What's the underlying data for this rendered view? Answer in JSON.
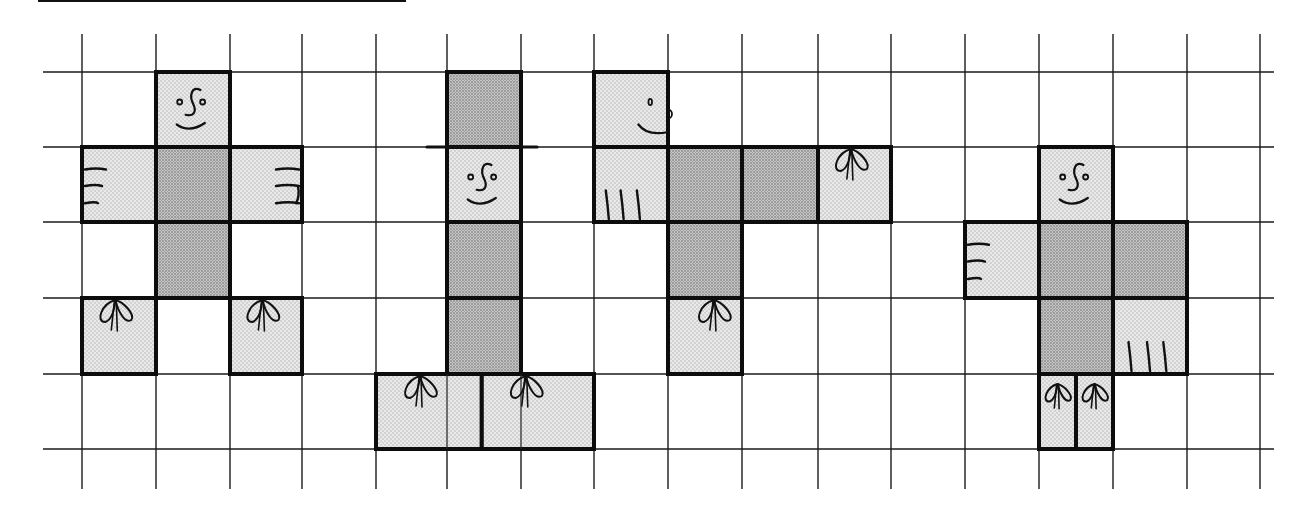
{
  "colors": {
    "background": "#ffffff",
    "grid_line": "#1a1a1a",
    "outline": "#0d0d0d",
    "light_fill": "#e9e9e9",
    "light_dot": "#b5b5b5",
    "dark_fill": "#bdbdbd",
    "dark_dot": "#8a8a8a"
  },
  "grid": {
    "columns_x": [
      82,
      156,
      230,
      302,
      376,
      447,
      521,
      594,
      668,
      742,
      818,
      891,
      965,
      1039,
      1113,
      1187,
      1260
    ],
    "rows_y": [
      72,
      147,
      222,
      298,
      374,
      449
    ],
    "h_line_start_x": 43,
    "h_line_end_x": 1274,
    "v_line_start_y": 34,
    "v_line_end_y": 489
  },
  "figures": [
    {
      "name": "figure-1-cross-net",
      "cells": [
        {
          "col": 1,
          "row": 0,
          "w": 1,
          "shade": "light",
          "decor": "face-front"
        },
        {
          "col": 0,
          "row": 1,
          "w": 1,
          "shade": "light",
          "decor": "hand-left"
        },
        {
          "col": 1,
          "row": 1,
          "w": 1,
          "shade": "dark",
          "decor": ""
        },
        {
          "col": 2,
          "row": 1,
          "w": 1,
          "shade": "light",
          "decor": "hand-right"
        },
        {
          "col": 1,
          "row": 2,
          "w": 1,
          "shade": "dark",
          "decor": ""
        },
        {
          "col": 0,
          "row": 3,
          "w": 1,
          "shade": "light",
          "decor": "bow"
        },
        {
          "col": 2,
          "row": 3,
          "w": 1,
          "shade": "light",
          "decor": "bow"
        }
      ]
    },
    {
      "name": "figure-2-hat-net",
      "cells": [
        {
          "col": 5,
          "row": 0,
          "w": 1,
          "shade": "dark",
          "decor": "hat-brim"
        },
        {
          "col": 5,
          "row": 1,
          "w": 1,
          "shade": "light",
          "decor": "face-front"
        },
        {
          "col": 5,
          "row": 2,
          "w": 1,
          "shade": "dark",
          "decor": ""
        },
        {
          "col": 5,
          "row": 3,
          "w": 1,
          "shade": "dark",
          "decor": ""
        },
        {
          "col": 4,
          "row": 4,
          "w": 1.47,
          "shade": "light",
          "decor": "bow-wide"
        },
        {
          "col": 5.47,
          "row": 4,
          "w": 1.53,
          "shade": "light",
          "decor": "bow-wide"
        }
      ]
    },
    {
      "name": "figure-3-profile-net",
      "cells": [
        {
          "col": 7,
          "row": 0,
          "w": 1,
          "shade": "light",
          "decor": "face-profile"
        },
        {
          "col": 7,
          "row": 1,
          "w": 1,
          "shade": "light",
          "decor": "hand-down"
        },
        {
          "col": 8,
          "row": 1,
          "w": 1,
          "shade": "dark",
          "decor": ""
        },
        {
          "col": 9,
          "row": 1,
          "w": 1,
          "shade": "dark",
          "decor": ""
        },
        {
          "col": 10,
          "row": 1,
          "w": 1,
          "shade": "light",
          "decor": "bow"
        },
        {
          "col": 8,
          "row": 2,
          "w": 1,
          "shade": "dark",
          "decor": ""
        },
        {
          "col": 8,
          "row": 3,
          "w": 1,
          "shade": "light",
          "decor": "bow-center"
        }
      ]
    },
    {
      "name": "figure-4-split-feet-net",
      "cells": [
        {
          "col": 13,
          "row": 1,
          "w": 1,
          "shade": "light",
          "decor": "face-front"
        },
        {
          "col": 12,
          "row": 2,
          "w": 1,
          "shade": "light",
          "decor": "hand-left"
        },
        {
          "col": 13,
          "row": 2,
          "w": 1,
          "shade": "dark",
          "decor": ""
        },
        {
          "col": 14,
          "row": 2,
          "w": 1,
          "shade": "dark",
          "decor": ""
        },
        {
          "col": 13,
          "row": 3,
          "w": 1,
          "shade": "dark",
          "decor": ""
        },
        {
          "col": 14,
          "row": 3,
          "w": 1,
          "shade": "light",
          "decor": "hand-down-right"
        },
        {
          "col": 13,
          "row": 4,
          "w": 0.5,
          "shade": "light",
          "decor": "bow-small"
        },
        {
          "col": 13.5,
          "row": 4,
          "w": 0.5,
          "shade": "light",
          "decor": "bow-small"
        }
      ]
    }
  ]
}
